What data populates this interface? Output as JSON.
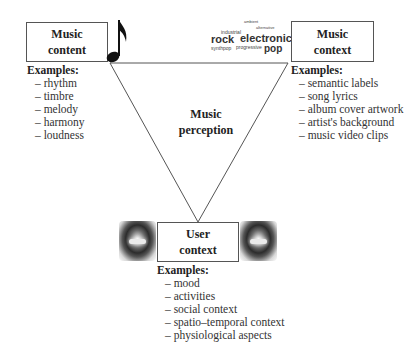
{
  "nodes": {
    "music_content": {
      "title_line1": "Music",
      "title_line2": "content",
      "examples_header": "Examples:",
      "examples": [
        "rhythm",
        "timbre",
        "melody",
        "harmony",
        "loudness"
      ]
    },
    "music_context": {
      "title_line1": "Music",
      "title_line2": "context",
      "examples_header": "Examples:",
      "examples": [
        "semantic labels",
        "song lyrics",
        "album cover artwork",
        "artist's background",
        "music video clips"
      ]
    },
    "user_context": {
      "title_line1": "User",
      "title_line2": "context",
      "examples_header": "Examples:",
      "examples": [
        "mood",
        "activities",
        "social context",
        "spatio–temporal context",
        "physiological aspects"
      ]
    }
  },
  "center": {
    "line1": "Music",
    "line2": "perception"
  },
  "icons": {
    "music_note": "♪",
    "word_cloud_words": [
      "industrial",
      "rock",
      "electronic",
      "synthpop",
      "progressive",
      "pop",
      "ambient",
      "alternative"
    ]
  },
  "colors": {
    "line": "#555555",
    "text": "#222222"
  }
}
